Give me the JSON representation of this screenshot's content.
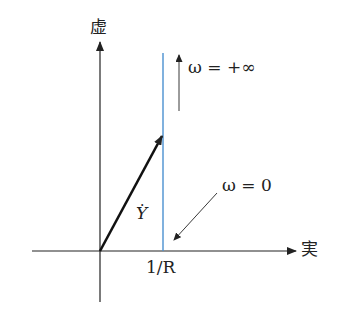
{
  "diagram": {
    "type": "admittance locus (vector diagram)",
    "axes": {
      "imag_label": "虚",
      "real_label": "実"
    },
    "vector": {
      "label": "Y",
      "accent": "dot"
    },
    "locus": {
      "color": "#4a90d0",
      "x_label": "1/R"
    },
    "annotations": {
      "omega_inf": "ω = +∞",
      "omega_zero": "ω = 0"
    },
    "colors": {
      "axis": "#222222",
      "locus": "#4a90d0"
    }
  }
}
